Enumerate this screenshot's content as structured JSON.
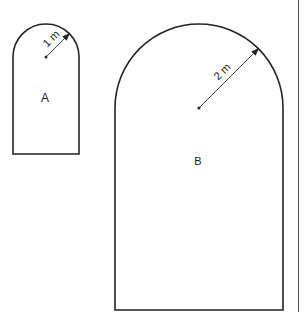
{
  "diagram": {
    "shapes": [
      {
        "id": "A",
        "label": "A",
        "radius_label": "1 m",
        "geometry": {
          "left": 13,
          "right": 79,
          "top": 24,
          "bottom": 154,
          "center_x": 46,
          "center_y": 57,
          "radius": 33
        },
        "arrow_tip": {
          "x": 69,
          "y": 34
        },
        "label_pos": {
          "x": 45,
          "y": 102
        }
      },
      {
        "id": "B",
        "label": "B",
        "radius_label": "2 m",
        "geometry": {
          "left": 115,
          "right": 283,
          "top": 24,
          "bottom": 310,
          "center_x": 199,
          "center_y": 108,
          "radius": 84
        },
        "arrow_tip": {
          "x": 257,
          "y": 50
        },
        "label_pos": {
          "x": 198,
          "y": 165
        }
      }
    ],
    "colors": {
      "stroke": "#222222",
      "background": "#ffffff"
    }
  }
}
